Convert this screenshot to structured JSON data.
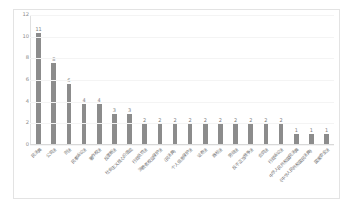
{
  "chart_data": {
    "type": "bar",
    "title": "",
    "xlabel": "",
    "ylabel": "",
    "ylim": [
      0,
      12
    ],
    "yticks": [
      "0",
      "2",
      "4",
      "6",
      "8",
      "10",
      "12"
    ],
    "grid": true,
    "legend": "none",
    "bar_color": "#8c8c8c",
    "categories": [
      "民法典",
      "公司法",
      "刑法",
      "民事诉讼法",
      "著作权法",
      "反垄断法",
      "社会主义核心价值观",
      "行政处罚法",
      "消费者权益保护法",
      "（民法典）",
      "个人信息保护法",
      "证券法",
      "商标法",
      "劳动法",
      "反不正当竞争法",
      "合同法",
      "行政诉讼法",
      "中华人民共和国民法典",
      "《中华人民共和国民法典》",
      "国家安全法"
    ],
    "values": [
      11,
      8,
      6,
      4,
      4,
      3,
      3,
      2,
      2,
      2,
      2,
      2,
      2,
      2,
      2,
      2,
      2,
      1,
      1,
      1
    ],
    "data_labels": [
      "11",
      "8",
      "6",
      "4",
      "4",
      "3",
      "3",
      "2",
      "2",
      "2",
      "2",
      "2",
      "2",
      "2",
      "2",
      "2",
      "2",
      "1",
      "1",
      "1"
    ]
  },
  "colors": {
    "bar": "#8c8c8c",
    "axis_text": "#8a8a8a",
    "grid": "#f4f4f4",
    "frame_border": "#e3e3e3",
    "background": "#ffffff"
  }
}
